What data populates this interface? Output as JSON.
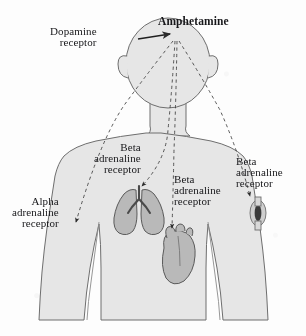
{
  "figure": {
    "drug_label": "Amphetamine",
    "colors": {
      "body_fill": "#e6e6e6",
      "body_stroke": "#6e6e6e",
      "organ_fill": "#b9b9b9",
      "organ_stroke": "#5a5a5a",
      "text": "#17171a",
      "arrow": "#2b2b2b",
      "background": "#fdfdfd"
    }
  },
  "labels": {
    "dopamine": {
      "line1": "Dopamine",
      "line2": "receptor"
    },
    "beta_lung": {
      "line1": "Beta",
      "line2": "adrenaline",
      "line3": "receptor"
    },
    "beta_heart": {
      "line1": "Beta",
      "line2": "adrenaline",
      "line3": "receptor"
    },
    "beta_vessel": {
      "line1": "Beta",
      "line2": "adrenaline",
      "line3": "receptor"
    },
    "alpha": {
      "line1": "Alpha",
      "line2": "adrenaline",
      "line3": "receptor"
    }
  },
  "anatomy": {
    "head": "head-silhouette",
    "torso": "torso-silhouette",
    "organs": [
      {
        "name": "lungs",
        "receptor": "beta-adrenaline"
      },
      {
        "name": "heart",
        "receptor": "beta-adrenaline"
      },
      {
        "name": "blood-vessel",
        "receptor": "beta-adrenaline"
      },
      {
        "name": "arm-vasculature",
        "receptor": "alpha-adrenaline"
      },
      {
        "name": "brain",
        "receptor": "dopamine"
      }
    ]
  },
  "connectors": [
    {
      "from": "amphetamine-origin",
      "to": "alpha-receptor-arm",
      "style": "dashed"
    },
    {
      "from": "amphetamine-origin",
      "to": "beta-receptor-lungs",
      "style": "dashed"
    },
    {
      "from": "amphetamine-origin",
      "to": "beta-receptor-heart",
      "style": "dashed"
    },
    {
      "from": "amphetamine-origin",
      "to": "beta-receptor-vessel",
      "style": "dashed"
    },
    {
      "from": "dopamine-label",
      "to": "amphetamine-origin",
      "style": "solid"
    }
  ]
}
